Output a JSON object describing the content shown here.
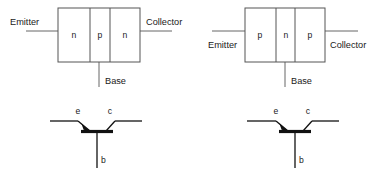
{
  "figure": {
    "background_color": "#ffffff",
    "line_color": "#555555",
    "symbol_color": "#111111",
    "text_color": "#1a1a1a"
  },
  "npn_structure": {
    "name": "NPN transistor structure",
    "regions": [
      {
        "label": "n"
      },
      {
        "label": "p"
      },
      {
        "label": "n"
      }
    ],
    "terminals": {
      "emitter": "Emitter",
      "base": "Base",
      "collector": "Collector"
    }
  },
  "pnp_structure": {
    "name": "PNP transistor structure",
    "regions": [
      {
        "label": "p"
      },
      {
        "label": "n"
      },
      {
        "label": "p"
      }
    ],
    "terminals": {
      "emitter": "Emitter",
      "base": "Base",
      "collector": "Collector"
    }
  },
  "npn_symbol": {
    "name": "NPN transistor schematic symbol",
    "terminals": {
      "emitter": "e",
      "collector": "c",
      "base": "b"
    }
  },
  "pnp_symbol": {
    "name": "PNP transistor schematic symbol",
    "terminals": {
      "emitter": "e",
      "collector": "c",
      "base": "b"
    }
  }
}
